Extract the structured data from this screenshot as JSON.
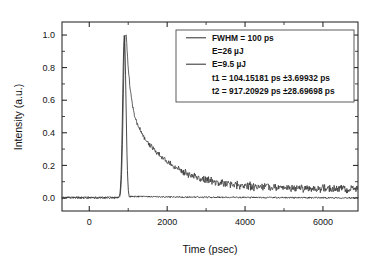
{
  "chart_data": {
    "type": "line",
    "title": "",
    "xlabel": "Time (psec)",
    "ylabel": "Intensity (a.u.)",
    "xlim": [
      -700,
      6900
    ],
    "ylim": [
      -0.08,
      1.08
    ],
    "xticks": [
      0,
      2000,
      4000,
      6000
    ],
    "xticklabels": [
      "0",
      "2000",
      "4000",
      "6000"
    ],
    "yticks": [
      0.0,
      0.2,
      0.4,
      0.6,
      0.8,
      1.0
    ],
    "yticklabels": [
      "0.0",
      "0.2",
      "0.4",
      "0.6",
      "0.8",
      "1.0"
    ],
    "x_minor_step": 1000,
    "y_minor_step": 0.1,
    "grid": false,
    "legend_position": "upper right",
    "frame": true,
    "ticks_direction": "in",
    "series": [
      {
        "name": "E=26 uJ",
        "label": "E=26 µJ",
        "style": "sharp-pulse",
        "peak_time": 900,
        "peak_value": 1.0,
        "fwhm_ps": 100,
        "baseline": 0.0
      },
      {
        "name": "E=9.5 uJ",
        "label": "E=9.5 µJ",
        "style": "biexponential-decay",
        "peak_time": 920,
        "peak_value": 1.0,
        "tau1_ps": 104.15181,
        "tau2_ps": 917.20929,
        "baseline": 0.055,
        "noise_amplitude": 0.02
      }
    ]
  },
  "legend": {
    "entries": [
      {
        "text": "FWHM = 100 ps",
        "has_line_sample": true
      },
      {
        "text": "E=26 µJ",
        "has_line_sample": false
      },
      {
        "text": "E=9.5 µJ",
        "has_line_sample": true
      },
      {
        "text": "t1 = 104.15181 ps ±3.69932 ps",
        "has_line_sample": false
      },
      {
        "text": "t2 = 917.20929 ps ±28.69698 ps",
        "has_line_sample": false
      }
    ]
  },
  "colors": {
    "background": "#ffffff",
    "axis": "#1a1a1a",
    "trace_sharp": "#2b2b2b",
    "trace_decay": "#3a3a3a",
    "legend_border": "#4a4a4a",
    "text": "#111111"
  }
}
